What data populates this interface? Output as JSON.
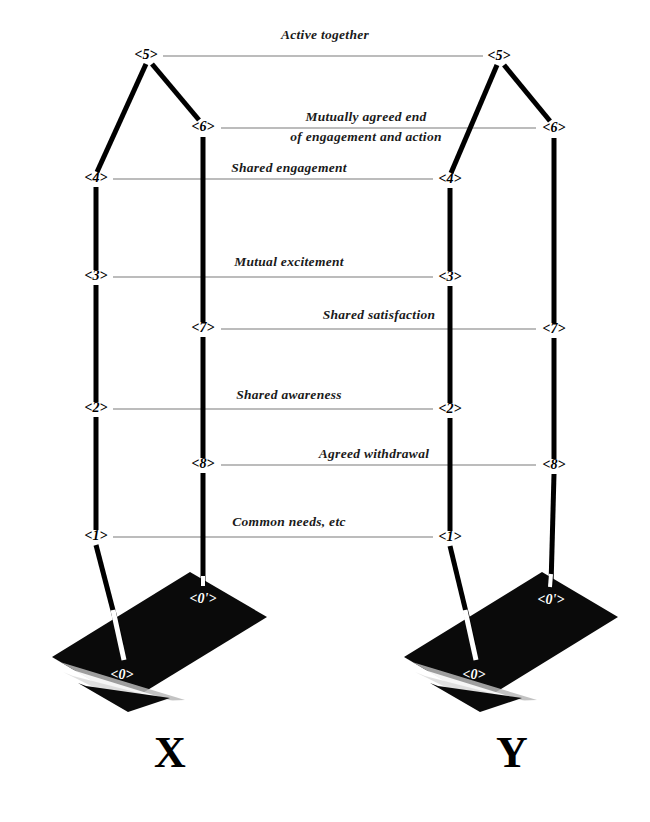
{
  "diagram": {
    "background_color": "#ffffff",
    "ink_color": "#000000",
    "connector_color": "#7a7a7a",
    "plane_color": "#0a0a0a",
    "columns": [
      {
        "id": "X",
        "letter": "X"
      },
      {
        "id": "Y",
        "letter": "Y"
      }
    ],
    "nodes": {
      "x_outer_5": "<5>",
      "x_outer_4": "<4>",
      "x_outer_3": "<3>",
      "x_outer_2": "<2>",
      "x_outer_1": "<1>",
      "x_outer_0": "<0>",
      "x_inner_6": "<6>",
      "x_inner_7": "<7>",
      "x_inner_8": "<8>",
      "x_inner_0p": "<0'>",
      "y_outer_5": "<5>",
      "y_outer_4": "<4>",
      "y_outer_3": "<3>",
      "y_outer_2": "<2>",
      "y_outer_1": "<1>",
      "y_outer_0": "<0>",
      "y_inner_6": "<6>",
      "y_inner_7": "<7>",
      "y_inner_8": "<8>",
      "y_inner_0p": "<0'>"
    },
    "edge_labels": {
      "active_together": "Active together",
      "mutually_agreed_line1": "Mutually agreed end",
      "mutually_agreed_line2": "of engagement and action",
      "shared_engagement": "Shared engagement",
      "mutual_excitement": "Mutual excitement",
      "shared_satisfaction": "Shared satisfaction",
      "shared_awareness": "Shared awareness",
      "agreed_withdrawal": "Agreed  withdrawal",
      "common_needs": "Common needs, etc"
    }
  }
}
